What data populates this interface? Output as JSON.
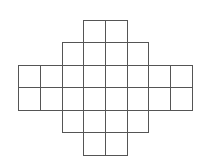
{
  "diagram": {
    "type": "cross-shaped square grid",
    "line_color": "#555555",
    "background": "#ffffff",
    "col_lines_x": [
      18,
      40,
      62,
      83,
      105,
      127,
      148,
      170,
      192
    ],
    "row_lines_y": [
      20,
      42,
      65,
      87,
      110,
      132,
      155
    ],
    "rows": [
      {
        "cols": [
          3,
          4
        ]
      },
      {
        "cols": [
          2,
          3,
          4,
          5
        ]
      },
      {
        "cols": [
          0,
          1,
          2,
          3,
          4,
          5,
          6,
          7
        ]
      },
      {
        "cols": [
          0,
          1,
          2,
          3,
          4,
          5,
          6,
          7
        ]
      },
      {
        "cols": [
          2,
          3,
          4,
          5
        ]
      },
      {
        "cols": [
          3,
          4
        ]
      }
    ],
    "cell_count": 24
  }
}
